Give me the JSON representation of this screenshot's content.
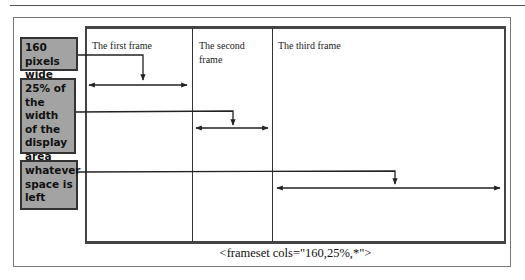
{
  "diagram": {
    "frames": [
      {
        "label": "The first frame"
      },
      {
        "label": "The second frame"
      },
      {
        "label": "The third frame"
      }
    ],
    "callouts": [
      {
        "text": "160 pixels wide"
      },
      {
        "text": "25% of the width of the display area"
      },
      {
        "text": "whatever space is left"
      }
    ],
    "caption": "<frameset cols=\"160,25%,*\">"
  },
  "colors": {
    "callout_fill": "#a3a3a3",
    "line": "#333333"
  }
}
